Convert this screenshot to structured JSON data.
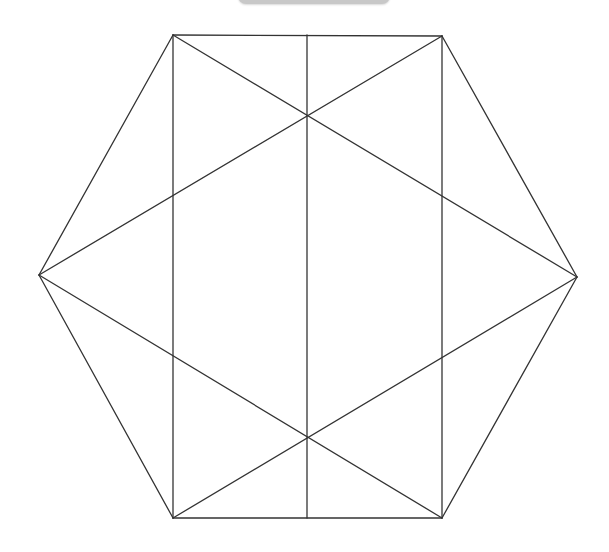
{
  "diagram": {
    "type": "geometric-figure",
    "stroke_color": "#333333",
    "background_color": "#ffffff",
    "top_bar_color": "#c8c8c8",
    "vertices": {
      "top_left": [
        173,
        35
      ],
      "top_right": [
        442,
        36
      ],
      "right": [
        577,
        277
      ],
      "bottom_right": [
        442,
        518
      ],
      "bottom_left": [
        173,
        518
      ],
      "left": [
        39,
        275
      ],
      "top_mid": [
        307,
        35
      ],
      "bottom_mid": [
        307,
        518
      ],
      "upper_cross": [
        307,
        116
      ],
      "lower_cross": [
        307,
        436
      ]
    },
    "segments": [
      {
        "name": "hex-edge-top",
        "from": "top_left",
        "to": "top_right"
      },
      {
        "name": "hex-edge-top-right",
        "from": "top_right",
        "to": "right"
      },
      {
        "name": "hex-edge-bottom-right",
        "from": "right",
        "to": "bottom_right"
      },
      {
        "name": "hex-edge-bottom",
        "from": "bottom_right",
        "to": "bottom_left"
      },
      {
        "name": "hex-edge-bottom-left",
        "from": "bottom_left",
        "to": "left"
      },
      {
        "name": "hex-edge-top-left",
        "from": "left",
        "to": "top_left"
      },
      {
        "name": "rect-edge-left",
        "from": "top_left",
        "to": "bottom_left"
      },
      {
        "name": "rect-edge-right",
        "from": "top_right",
        "to": "bottom_right"
      },
      {
        "name": "center-vertical",
        "from": "top_mid",
        "to": "bottom_mid"
      },
      {
        "name": "diag-topleft-right",
        "from": "top_left",
        "to": "right"
      },
      {
        "name": "diag-topright-left",
        "from": "top_right",
        "to": "left"
      },
      {
        "name": "diag-bottomleft-right",
        "from": "bottom_left",
        "to": "right"
      },
      {
        "name": "diag-bottomright-left",
        "from": "bottom_right",
        "to": "left"
      }
    ]
  }
}
